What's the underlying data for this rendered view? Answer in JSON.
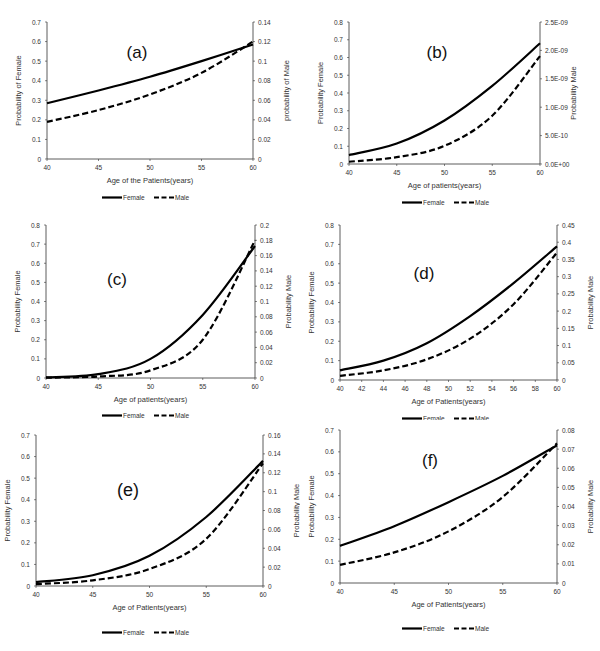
{
  "figure": {
    "caption_fragment": "",
    "panels_layout": "3 rows x 2 columns"
  },
  "legend": {
    "female_label": "Female",
    "male_label": "Male"
  },
  "chart_data": [
    {
      "id": "a",
      "type": "line",
      "title": "(a)",
      "xlabel": "Age of the Patients(years)",
      "ylabel": "Probability of Female",
      "y2label": "probability of Male",
      "xlim": [
        40,
        60
      ],
      "xticks": [
        "40",
        "45",
        "50",
        "55",
        "60"
      ],
      "ylim": [
        0,
        0.7
      ],
      "yticks": [
        "0",
        "0.1",
        "0.2",
        "0.3",
        "0.4",
        "0.5",
        "0.6",
        "0.7"
      ],
      "y2lim": [
        0,
        0.14
      ],
      "y2ticks": [
        "0",
        "0.02",
        "0.04",
        "0.06",
        "0.08",
        "0.1",
        "0.12",
        "0.14"
      ],
      "grid": false,
      "legend_position": "bottom",
      "x": [
        40,
        45,
        50,
        55,
        60
      ],
      "series": [
        {
          "name": "Female",
          "axis": "left",
          "style": "solid",
          "values": [
            0.285,
            0.35,
            0.42,
            0.5,
            0.585
          ]
        },
        {
          "name": "Male",
          "axis": "right",
          "style": "dashed",
          "values": [
            0.038,
            0.05,
            0.066,
            0.088,
            0.12
          ]
        }
      ]
    },
    {
      "id": "b",
      "type": "line",
      "title": "(b)",
      "xlabel": "Age of patients(years)",
      "ylabel": "Probability Female",
      "y2label": "Probability Male",
      "xlim": [
        40,
        60
      ],
      "xticks": [
        "40",
        "45",
        "50",
        "55",
        "60"
      ],
      "ylim": [
        0,
        0.8
      ],
      "yticks": [
        "0",
        "0.1",
        "0.2",
        "0.3",
        "0.4",
        "0.5",
        "0.6",
        "0.7",
        "0.8"
      ],
      "y2lim": [
        0,
        2.5e-09
      ],
      "y2ticks": [
        "0.0E+00",
        "5.0E-10",
        "1.0E-09",
        "1.5E-09",
        "2.0E-09",
        "2.5E-09"
      ],
      "grid": false,
      "legend_position": "bottom",
      "x": [
        40,
        45,
        50,
        55,
        60
      ],
      "series": [
        {
          "name": "Female",
          "axis": "left",
          "style": "solid",
          "values": [
            0.05,
            0.115,
            0.245,
            0.44,
            0.68
          ]
        },
        {
          "name": "Male",
          "axis": "right",
          "style": "dashed",
          "values": [
            4e-11,
            1.2e-10,
            3.2e-10,
            8.5e-10,
            1.9e-09
          ]
        }
      ]
    },
    {
      "id": "c",
      "type": "line",
      "title": "(c)",
      "xlabel": "Age of patients(years)",
      "ylabel": "Probability Female",
      "y2label": "Probability Male",
      "xlim": [
        40,
        60
      ],
      "xticks": [
        "40",
        "45",
        "50",
        "55",
        "60"
      ],
      "ylim": [
        0,
        0.8
      ],
      "yticks": [
        "0",
        "0.1",
        "0.2",
        "0.3",
        "0.4",
        "0.5",
        "0.6",
        "0.7",
        "0.8"
      ],
      "y2lim": [
        0,
        0.2
      ],
      "y2ticks": [
        "0",
        "0.02",
        "0.04",
        "0.06",
        "0.08",
        "0.1",
        "0.12",
        "0.14",
        "0.16",
        "0.18",
        "0.2"
      ],
      "grid": false,
      "legend_position": "bottom",
      "x": [
        40,
        45,
        50,
        55,
        60
      ],
      "series": [
        {
          "name": "Female",
          "axis": "left",
          "style": "solid",
          "values": [
            0.003,
            0.02,
            0.1,
            0.33,
            0.69
          ]
        },
        {
          "name": "Male",
          "axis": "right",
          "style": "dashed",
          "values": [
            0.0005,
            0.002,
            0.01,
            0.05,
            0.18
          ]
        }
      ]
    },
    {
      "id": "d",
      "type": "line",
      "title": "(d)",
      "xlabel": "Age of Patients(years)",
      "ylabel": "Probability Female",
      "y2label": "Probability Male",
      "xlim": [
        40,
        60
      ],
      "xticks": [
        "40",
        "42",
        "44",
        "46",
        "48",
        "50",
        "52",
        "54",
        "56",
        "58",
        "60"
      ],
      "ylim": [
        0,
        0.8
      ],
      "yticks": [
        "0",
        "0.1",
        "0.2",
        "0.3",
        "0.4",
        "0.5",
        "0.6",
        "0.7",
        "0.8"
      ],
      "y2lim": [
        0,
        0.45
      ],
      "y2ticks": [
        "0",
        "0.05",
        "0.1",
        "0.15",
        "0.2",
        "0.25",
        "0.3",
        "0.35",
        "0.4",
        "0.45"
      ],
      "grid": false,
      "legend_position": "bottom",
      "x": [
        40,
        44,
        48,
        52,
        56,
        60
      ],
      "series": [
        {
          "name": "Female",
          "axis": "left",
          "style": "solid",
          "values": [
            0.05,
            0.1,
            0.19,
            0.33,
            0.5,
            0.69
          ]
        },
        {
          "name": "Male",
          "axis": "right",
          "style": "dashed",
          "values": [
            0.012,
            0.028,
            0.06,
            0.12,
            0.22,
            0.37
          ]
        }
      ]
    },
    {
      "id": "e",
      "type": "line",
      "title": "(e)",
      "xlabel": "Age of Patients(years)",
      "ylabel": "Probability Female",
      "y2label": "Probability Male",
      "xlim": [
        40,
        60
      ],
      "xticks": [
        "40",
        "45",
        "50",
        "55",
        "60"
      ],
      "ylim": [
        0,
        0.7
      ],
      "yticks": [
        "0",
        "0.1",
        "0.2",
        "0.3",
        "0.4",
        "0.5",
        "0.6",
        "0.7"
      ],
      "y2lim": [
        0,
        0.16
      ],
      "y2ticks": [
        "0",
        "0.02",
        "0.04",
        "0.06",
        "0.08",
        "0.1",
        "0.12",
        "0.14",
        "0.16"
      ],
      "grid": false,
      "legend_position": "bottom",
      "x": [
        40,
        45,
        50,
        55,
        60
      ],
      "series": [
        {
          "name": "Female",
          "axis": "left",
          "style": "solid",
          "values": [
            0.018,
            0.05,
            0.14,
            0.32,
            0.58
          ]
        },
        {
          "name": "Male",
          "axis": "right",
          "style": "dashed",
          "values": [
            0.002,
            0.006,
            0.018,
            0.05,
            0.13
          ]
        }
      ]
    },
    {
      "id": "f",
      "type": "line",
      "title": "(f)",
      "xlabel": "Age of Patients(years)",
      "ylabel": "Probability Female",
      "y2label": "Probability Male",
      "xlim": [
        40,
        60
      ],
      "xticks": [
        "40",
        "45",
        "50",
        "55",
        "60"
      ],
      "ylim": [
        0,
        0.7
      ],
      "yticks": [
        "0",
        "0.1",
        "0.2",
        "0.3",
        "0.4",
        "0.5",
        "0.6",
        "0.7"
      ],
      "y2lim": [
        0,
        0.08
      ],
      "y2ticks": [
        "0",
        "0.01",
        "0.02",
        "0.03",
        "0.04",
        "0.05",
        "0.06",
        "0.07",
        "0.08"
      ],
      "grid": false,
      "legend_position": "bottom",
      "x": [
        40,
        45,
        50,
        55,
        60
      ],
      "series": [
        {
          "name": "Female",
          "axis": "left",
          "style": "solid",
          "values": [
            0.17,
            0.26,
            0.37,
            0.49,
            0.63
          ]
        },
        {
          "name": "Male",
          "axis": "right",
          "style": "dashed",
          "values": [
            0.0095,
            0.016,
            0.027,
            0.045,
            0.073
          ]
        }
      ]
    }
  ],
  "layout": {
    "panels": [
      {
        "id": "a",
        "left": 0,
        "top": 0,
        "width": 300,
        "height": 205,
        "plot": {
          "x0": 47,
          "y0": 22,
          "x1": 253,
          "y1": 159
        },
        "title_pos": [
          137,
          58
        ],
        "legend_y": 200,
        "title_size": 17
      },
      {
        "id": "b",
        "left": 300,
        "top": 0,
        "width": 300,
        "height": 205,
        "plot": {
          "x0": 49,
          "y0": 22,
          "x1": 240,
          "y1": 164
        },
        "title_pos": [
          137,
          58
        ],
        "legend_y": 205,
        "title_size": 17
      },
      {
        "id": "c",
        "left": 0,
        "top": 205,
        "width": 300,
        "height": 215,
        "plot": {
          "x0": 46,
          "y0": 20,
          "x1": 255,
          "y1": 173
        },
        "title_pos": [
          117,
          80
        ],
        "legend_y": 213,
        "title_size": 17
      },
      {
        "id": "d",
        "left": 300,
        "top": 205,
        "width": 300,
        "height": 215,
        "plot": {
          "x0": 40,
          "y0": 20,
          "x1": 257,
          "y1": 175
        },
        "title_pos": [
          124,
          74
        ],
        "legend_y": 216,
        "title_size": 17
      },
      {
        "id": "e",
        "left": 0,
        "top": 420,
        "width": 300,
        "height": 231,
        "plot": {
          "x0": 36,
          "y0": 15,
          "x1": 263,
          "y1": 166
        },
        "title_pos": [
          128,
          76
        ],
        "legend_y": 215,
        "title_size": 18
      },
      {
        "id": "f",
        "left": 300,
        "top": 420,
        "width": 300,
        "height": 231,
        "plot": {
          "x0": 40,
          "y0": 10,
          "x1": 257,
          "y1": 163
        },
        "title_pos": [
          130,
          46
        ],
        "legend_y": 211,
        "title_size": 17
      }
    ]
  }
}
